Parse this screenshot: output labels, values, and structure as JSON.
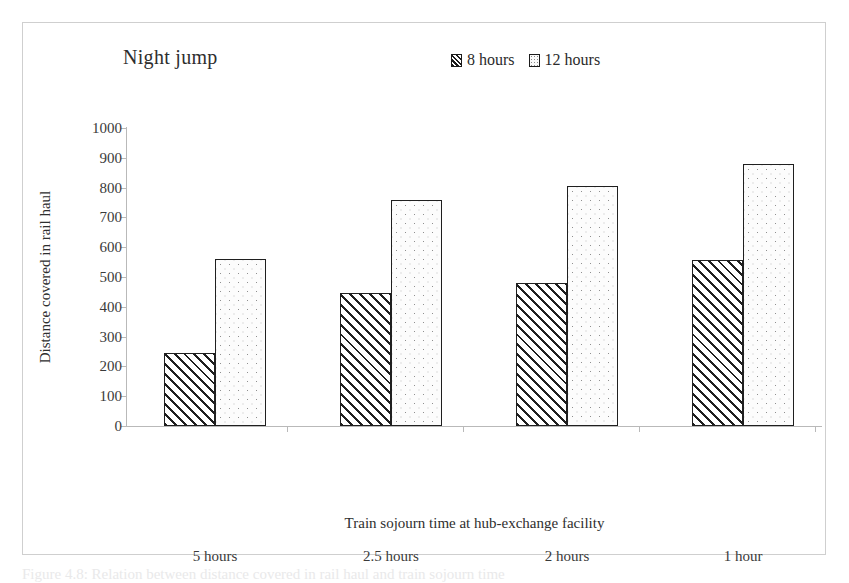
{
  "figure": {
    "caption_partial": "Figure 4.8:  Relation between distance covered in rail haul and train sojourn time"
  },
  "chart_data": {
    "type": "bar",
    "title": "Night jump",
    "xlabel": "Train sojourn time at hub-exchange facility",
    "ylabel": "Distance covered in rail haul",
    "ylim": [
      0,
      1000
    ],
    "ytick_step": 100,
    "yticks": [
      "1000",
      "900",
      "800",
      "700",
      "600",
      "500",
      "400",
      "300",
      "200",
      "100",
      "0"
    ],
    "grid": false,
    "legend_position": "top-center",
    "categories": [
      "5 hours",
      "2.5 hours",
      "2 hours",
      "1 hour"
    ],
    "series": [
      {
        "name": "8 hours",
        "pattern": "diagonal-hatch",
        "values": [
          245,
          445,
          480,
          557
        ]
      },
      {
        "name": "12 hours",
        "pattern": "dotted",
        "values": [
          560,
          757,
          805,
          880
        ]
      }
    ]
  }
}
